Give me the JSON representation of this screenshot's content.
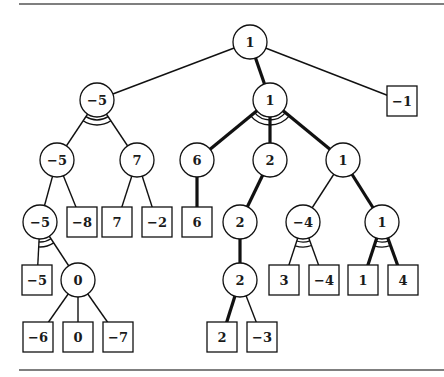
{
  "diagram": {
    "colors": {
      "line": "#111111",
      "rule": "#555555",
      "background": "#ffffff"
    },
    "nodes": [
      {
        "id": "n0",
        "label": "1",
        "shape": "circle",
        "x": 250,
        "y": 42
      },
      {
        "id": "n1",
        "label": "−5",
        "shape": "circle",
        "x": 97,
        "y": 100,
        "arc": true
      },
      {
        "id": "n2",
        "label": "1",
        "shape": "circle",
        "x": 270,
        "y": 100,
        "arc": true
      },
      {
        "id": "n3",
        "label": "−1",
        "shape": "square",
        "x": 402,
        "y": 101
      },
      {
        "id": "n4",
        "label": "−5",
        "shape": "circle",
        "x": 57,
        "y": 160
      },
      {
        "id": "n5",
        "label": "7",
        "shape": "circle",
        "x": 137,
        "y": 160
      },
      {
        "id": "n6",
        "label": "6",
        "shape": "circle",
        "x": 197,
        "y": 160
      },
      {
        "id": "n7",
        "label": "2",
        "shape": "circle",
        "x": 270,
        "y": 160
      },
      {
        "id": "n8",
        "label": "1",
        "shape": "circle",
        "x": 343,
        "y": 160
      },
      {
        "id": "n9",
        "label": "−5",
        "shape": "circle",
        "x": 40,
        "y": 222,
        "arc": true
      },
      {
        "id": "n10",
        "label": "−8",
        "shape": "square",
        "x": 82,
        "y": 222
      },
      {
        "id": "n11",
        "label": "7",
        "shape": "square",
        "x": 117,
        "y": 222
      },
      {
        "id": "n12",
        "label": "−2",
        "shape": "square",
        "x": 157,
        "y": 222
      },
      {
        "id": "n13",
        "label": "6",
        "shape": "square",
        "x": 197,
        "y": 222
      },
      {
        "id": "n14",
        "label": "2",
        "shape": "circle",
        "x": 240,
        "y": 222
      },
      {
        "id": "n15",
        "label": "−4",
        "shape": "circle",
        "x": 303,
        "y": 222,
        "arc": true
      },
      {
        "id": "n16",
        "label": "1",
        "shape": "circle",
        "x": 382,
        "y": 222,
        "arc": true
      },
      {
        "id": "n17",
        "label": "−5",
        "shape": "square",
        "x": 37,
        "y": 280
      },
      {
        "id": "n18",
        "label": "0",
        "shape": "circle",
        "x": 78,
        "y": 280
      },
      {
        "id": "n19",
        "label": "2",
        "shape": "circle",
        "x": 240,
        "y": 280
      },
      {
        "id": "n20",
        "label": "3",
        "shape": "square",
        "x": 284,
        "y": 280
      },
      {
        "id": "n21",
        "label": "−4",
        "shape": "square",
        "x": 324,
        "y": 280
      },
      {
        "id": "n22",
        "label": "1",
        "shape": "square",
        "x": 363,
        "y": 280
      },
      {
        "id": "n23",
        "label": "4",
        "shape": "square",
        "x": 403,
        "y": 280
      },
      {
        "id": "n24",
        "label": "−6",
        "shape": "square",
        "x": 38,
        "y": 337
      },
      {
        "id": "n25",
        "label": "0",
        "shape": "square",
        "x": 78,
        "y": 337
      },
      {
        "id": "n26",
        "label": "−7",
        "shape": "square",
        "x": 118,
        "y": 337
      },
      {
        "id": "n27",
        "label": "2",
        "shape": "square",
        "x": 222,
        "y": 337
      },
      {
        "id": "n28",
        "label": "−3",
        "shape": "square",
        "x": 262,
        "y": 337
      }
    ],
    "edges": [
      {
        "from": "n0",
        "to": "n1",
        "bold": false
      },
      {
        "from": "n0",
        "to": "n2",
        "bold": true
      },
      {
        "from": "n0",
        "to": "n3",
        "bold": false
      },
      {
        "from": "n1",
        "to": "n4",
        "bold": false
      },
      {
        "from": "n1",
        "to": "n5",
        "bold": false
      },
      {
        "from": "n2",
        "to": "n6",
        "bold": true
      },
      {
        "from": "n2",
        "to": "n7",
        "bold": true
      },
      {
        "from": "n2",
        "to": "n8",
        "bold": true
      },
      {
        "from": "n4",
        "to": "n9",
        "bold": false
      },
      {
        "from": "n4",
        "to": "n10",
        "bold": false
      },
      {
        "from": "n5",
        "to": "n11",
        "bold": false
      },
      {
        "from": "n5",
        "to": "n12",
        "bold": false
      },
      {
        "from": "n6",
        "to": "n13",
        "bold": true
      },
      {
        "from": "n7",
        "to": "n14",
        "bold": true
      },
      {
        "from": "n8",
        "to": "n15",
        "bold": false
      },
      {
        "from": "n8",
        "to": "n16",
        "bold": true
      },
      {
        "from": "n9",
        "to": "n17",
        "bold": false
      },
      {
        "from": "n9",
        "to": "n18",
        "bold": false
      },
      {
        "from": "n14",
        "to": "n19",
        "bold": true
      },
      {
        "from": "n15",
        "to": "n20",
        "bold": false
      },
      {
        "from": "n15",
        "to": "n21",
        "bold": false
      },
      {
        "from": "n16",
        "to": "n22",
        "bold": true
      },
      {
        "from": "n16",
        "to": "n23",
        "bold": true
      },
      {
        "from": "n18",
        "to": "n24",
        "bold": false
      },
      {
        "from": "n18",
        "to": "n25",
        "bold": false
      },
      {
        "from": "n18",
        "to": "n26",
        "bold": false
      },
      {
        "from": "n19",
        "to": "n27",
        "bold": true
      },
      {
        "from": "n19",
        "to": "n28",
        "bold": false
      }
    ]
  }
}
